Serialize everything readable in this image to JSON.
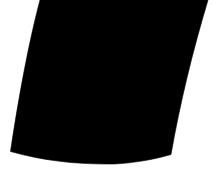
{
  "canvas": {
    "width": 217,
    "height": 184,
    "background_color": "#ffffff",
    "description": "Blacked-out rectangular screen region photographed at a slight angle on a white background"
  },
  "shape": {
    "name": "blacked-out-screen",
    "fill_color": "#000000",
    "stroke_color": "#000000",
    "opacity": 1,
    "edge_softness_px": 1.5,
    "path": "M 40 0 C 31 34 21 82 10.5 151.5 C 44 161 78 164.5 114 164 C 134 163 154 159.5 171 154.5 C 180 103 193 50 208 0 Z",
    "vertices": [
      {
        "name": "top-left",
        "x": 40,
        "y": 0
      },
      {
        "name": "bottom-left",
        "x": 10.5,
        "y": 151.5
      },
      {
        "name": "bottom-mid-low",
        "x": 114,
        "y": 164
      },
      {
        "name": "bottom-right",
        "x": 171,
        "y": 154.5
      },
      {
        "name": "top-right",
        "x": 208,
        "y": 0
      }
    ],
    "edges": [
      {
        "name": "top-edge",
        "note": "clipped by canvas top, spans x 40 to 208",
        "curvature": "straight"
      },
      {
        "name": "left-edge",
        "note": "slightly concave, leans left going down",
        "curvature": "concave"
      },
      {
        "name": "bottom-edge",
        "note": "shallow convex sag, lowest near x 114",
        "curvature": "convex"
      },
      {
        "name": "right-edge",
        "note": "slightly concave, leans right going up",
        "curvature": "concave"
      }
    ]
  },
  "accessibility": {
    "alt_text": "Solid black quadrilateral region on a white background"
  }
}
